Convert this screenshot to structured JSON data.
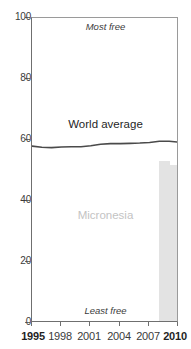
{
  "title_fragment": "Freedom",
  "chart_data": {
    "type": "line",
    "title": "",
    "xlabel": "",
    "ylabel": "",
    "xlim": [
      1995,
      2010
    ],
    "ylim": [
      0,
      100
    ],
    "grid": false,
    "legend": "inline-labels",
    "x_ticks": [
      {
        "value": 1995,
        "label": "1995",
        "bold": true
      },
      {
        "value": 1998,
        "label": "1998",
        "bold": false
      },
      {
        "value": 2001,
        "label": "2001",
        "bold": false
      },
      {
        "value": 2004,
        "label": "2004",
        "bold": false
      },
      {
        "value": 2007,
        "label": "2007",
        "bold": false
      },
      {
        "value": 2010,
        "label": "2010",
        "bold": true
      }
    ],
    "y_ticks": [
      {
        "value": 0,
        "label": "0"
      },
      {
        "value": 20,
        "label": "20"
      },
      {
        "value": 40,
        "label": "40"
      },
      {
        "value": 60,
        "label": "60"
      },
      {
        "value": 80,
        "label": "80"
      },
      {
        "value": 100,
        "label": "100"
      }
    ],
    "annotations": [
      {
        "name": "most-free",
        "text": "Most free",
        "value": 100
      },
      {
        "name": "least-free",
        "text": "Least free",
        "value": 0
      }
    ],
    "series": [
      {
        "name": "World average",
        "type": "line",
        "color": "#4a4a4a",
        "x": [
          1995,
          1996,
          1997,
          1998,
          1999,
          2000,
          2001,
          2002,
          2003,
          2004,
          2005,
          2006,
          2007,
          2008,
          2009,
          2010
        ],
        "values": [
          58.0,
          57.6,
          57.5,
          57.7,
          57.8,
          57.8,
          58.1,
          58.6,
          58.8,
          58.8,
          58.9,
          59.0,
          59.2,
          59.6,
          59.6,
          59.3
        ]
      },
      {
        "name": "Micronesia",
        "type": "bar",
        "color": "#e3e3e3",
        "x": [
          2009,
          2010
        ],
        "values": [
          52.5,
          51.2
        ]
      }
    ]
  }
}
